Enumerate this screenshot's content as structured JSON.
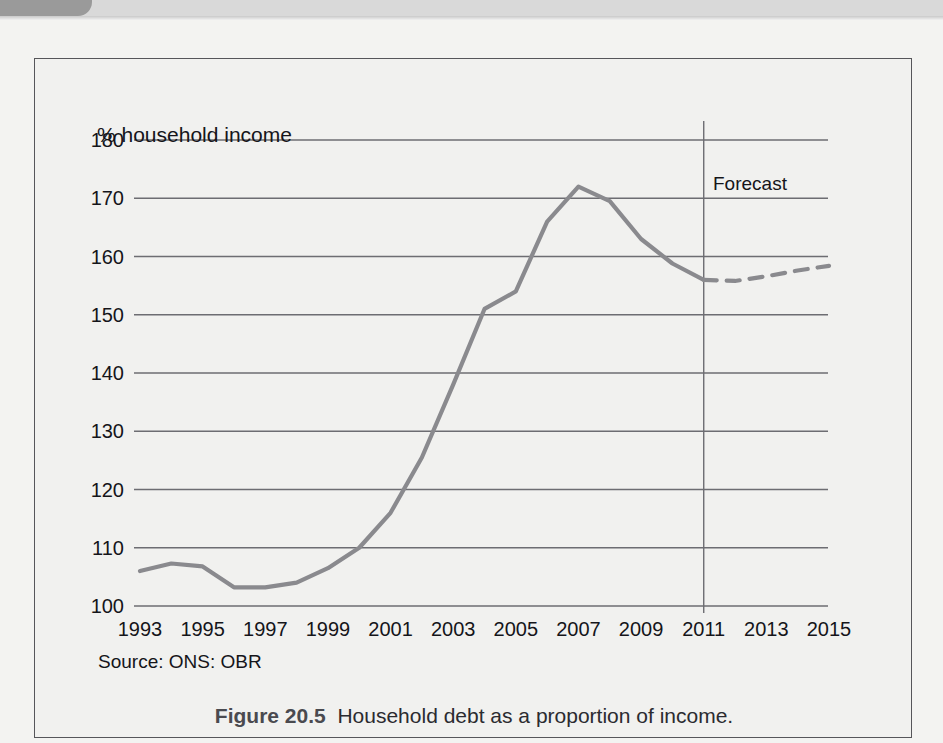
{
  "figure": {
    "caption_label": "Figure 20.5",
    "caption_text": "Household debt as a proportion of income.",
    "source_note": "Source: ONS: OBR",
    "forecast_label": "Forecast",
    "y_axis_title": "% household income"
  },
  "colors": {
    "series_line": "#8a8a8e",
    "gridline": "#6d6d72",
    "axis_text": "#15151a",
    "frame": "#56565a",
    "page_background": "#f3f3f1",
    "figure_background": "#f1f1ef",
    "header_tab": "#9a9a9a",
    "header_band": "#d9d9d9"
  },
  "chart_data": {
    "type": "line",
    "title": "Household debt as a proportion of income",
    "xlabel": "",
    "ylabel": "% household income",
    "ylim": [
      100,
      180
    ],
    "xlim": [
      1993,
      2015
    ],
    "ytick_labels": [
      "180",
      "170",
      "160",
      "150",
      "140",
      "130",
      "120",
      "110",
      "100"
    ],
    "ytick_values": [
      180,
      170,
      160,
      150,
      140,
      130,
      120,
      110,
      100
    ],
    "xtick_labels": [
      "1993",
      "1995",
      "1997",
      "1999",
      "2001",
      "2003",
      "2005",
      "2007",
      "2009",
      "2011",
      "2013",
      "2015"
    ],
    "xtick_values": [
      1993,
      1995,
      1997,
      1999,
      2001,
      2003,
      2005,
      2007,
      2009,
      2011,
      2013,
      2015
    ],
    "grid": true,
    "legend": "none",
    "annotations": [
      {
        "text": "Forecast",
        "x": 2011,
        "type": "vertical-divider-label"
      }
    ],
    "forecast_start_year": 2011,
    "series": [
      {
        "name": "Household debt (% of household income)",
        "style": "solid",
        "x": [
          1993,
          1994,
          1995,
          1996,
          1997,
          1998,
          1999,
          2000,
          2001,
          2002,
          2003,
          2004,
          2005,
          2006,
          2007,
          2008,
          2009,
          2010,
          2011
        ],
        "values": [
          106.0,
          107.3,
          106.8,
          103.2,
          103.2,
          104.0,
          106.5,
          110.0,
          116.0,
          125.5,
          138.0,
          151.0,
          154.0,
          166.0,
          172.0,
          169.5,
          163.0,
          158.8,
          156.0
        ]
      },
      {
        "name": "Household debt forecast",
        "style": "dashed",
        "x": [
          2011,
          2012,
          2013,
          2014,
          2015
        ],
        "values": [
          156.0,
          155.8,
          156.6,
          157.6,
          158.4
        ]
      }
    ]
  }
}
